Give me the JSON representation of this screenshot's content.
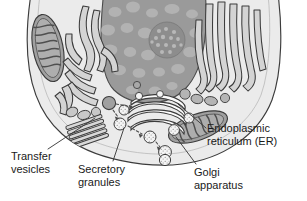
{
  "figure": {
    "background_color": "#ffffff",
    "width": 307,
    "height": 201
  },
  "palette": {
    "outline": "#3c3c3c",
    "cytoplasm": "#ebebeb",
    "nucleus_fill": "#9a9a9a",
    "chromatin_blob": "#b0b0b0",
    "nucleolus_fill": "#8a8a8a",
    "er_fill": "#d2d2d2",
    "mitochondria_fill": "#9f9f9f",
    "vesicle_fill": "#f2f2f2",
    "granule_fill": "#a8a8a8",
    "label_text": "#1a1a1a",
    "leader_line": "#3c3c3c"
  },
  "labels": {
    "transfer_vesicles": {
      "line1": "Transfer",
      "line2": "vesicles"
    },
    "secretory_granules": {
      "line1": "Secretory",
      "line2": "granules"
    },
    "golgi_apparatus": {
      "line1": "Golgi",
      "line2": "apparatus"
    },
    "endoplasmic_reticulum": {
      "line1": "Endoplasmic",
      "line2": "reticulum (ER)"
    }
  },
  "structures": [
    {
      "name": "nucleus",
      "description": "large gray dome at top center with chromatin blobs"
    },
    {
      "name": "nucleolus",
      "description": "dense speckled circle inside nucleus, right of center"
    },
    {
      "name": "rough-er-left",
      "description": "branching curved tubule network at upper left"
    },
    {
      "name": "rough-er-right",
      "description": "vertical finger-like tubules at upper right"
    },
    {
      "name": "rough-er-stack",
      "description": "parallel flattened cisternae at lower left"
    },
    {
      "name": "mitochondrion-left",
      "description": "elongated oval with cristae, upper left"
    },
    {
      "name": "mitochondrion-right",
      "description": "tilted oval with cristae, lower right"
    },
    {
      "name": "golgi-apparatus",
      "description": "stack of curved flattened cisternae at center"
    },
    {
      "name": "transfer-vesicles",
      "description": "small speckled vesicles near golgi"
    },
    {
      "name": "secretory-granules",
      "description": "speckled granules moving toward membrane"
    },
    {
      "name": "secreted-particles",
      "description": "dotted spray exiting cell membrane at bottom"
    },
    {
      "name": "cell-membrane",
      "description": "rounded cell boundary"
    }
  ]
}
